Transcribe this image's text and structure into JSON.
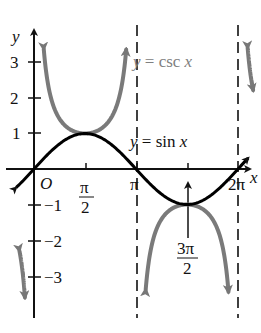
{
  "chart_data": {
    "type": "line",
    "title": "",
    "xlabel": "x",
    "ylabel": "y",
    "origin_label": "O",
    "x_ticks": [
      {
        "value": 1.5708,
        "label_num": "π",
        "label_den": "2"
      },
      {
        "value": 3.1416,
        "label": "π"
      },
      {
        "value": 4.7124,
        "label_num": "3π",
        "label_den": "2"
      },
      {
        "value": 6.2832,
        "label": "2π"
      }
    ],
    "y_ticks": [
      {
        "value": 3,
        "label": "3"
      },
      {
        "value": 2,
        "label": "2"
      },
      {
        "value": 1,
        "label": "1"
      },
      {
        "value": -1,
        "label": "−1"
      },
      {
        "value": -2,
        "label": "−2"
      },
      {
        "value": -3,
        "label": "−3"
      }
    ],
    "xlim": [
      -0.6,
      6.8
    ],
    "ylim": [
      -3.8,
      3.8
    ],
    "grid": false,
    "series": [
      {
        "name": "y = sin x",
        "color": "#000000",
        "function": "sin",
        "x_range": [
          -0.55,
          6.6
        ]
      },
      {
        "name": "y = csc x",
        "color": "#808080",
        "function": "csc",
        "branches": [
          [
            -0.45,
            -0.28
          ],
          [
            0.3,
            2.84
          ],
          [
            3.44,
            5.99
          ],
          [
            6.58,
            6.75
          ]
        ]
      }
    ],
    "asymptotes": [
      3.1416,
      6.2832
    ],
    "annotations": [
      {
        "text": "y = csc x",
        "color": "#808080"
      },
      {
        "text": "y = sin x",
        "color": "#000000"
      }
    ]
  },
  "labels": {
    "y_axis": "y",
    "x_axis": "x",
    "origin": "O",
    "csc_y": "y",
    "csc_rest": " = csc ",
    "csc_x": "x",
    "sin_y": "y",
    "sin_rest": " = sin ",
    "sin_x": "x",
    "tick_pi_half_num": "π",
    "tick_pi_half_den": "2",
    "tick_pi": "π",
    "tick_3pi_half_num": "3π",
    "tick_3pi_half_den": "2",
    "tick_2pi": "2π",
    "y3": "3",
    "y2": "2",
    "y1": "1",
    "ym1": "−1",
    "ym2": "−2",
    "ym3": "−3"
  }
}
